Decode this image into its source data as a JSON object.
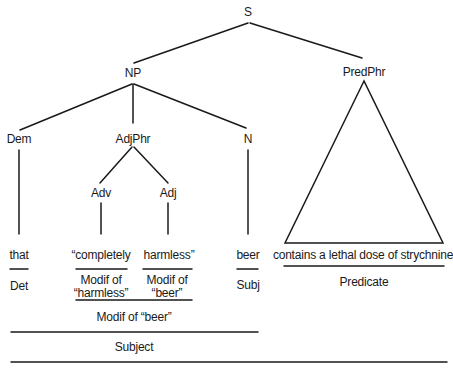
{
  "tree": {
    "root": "S",
    "nodes": {
      "s": "S",
      "np": "NP",
      "predphr": "PredPhr",
      "dem": "Dem",
      "adjphr": "AdjPhr",
      "n": "N",
      "adv": "Adv",
      "adj": "Adj"
    },
    "leaves": {
      "that": "that",
      "completely": "“completely",
      "harmless": "harmless”",
      "beer": "beer",
      "predicate_phrase": "contains a lethal dose of strychnine"
    }
  },
  "functions": {
    "det": "Det",
    "modif_harmless_line1": "Modif of",
    "modif_harmless_line2": "“harmless”",
    "modif_beer_line1": "Modif of",
    "modif_beer_line2": "“beer”",
    "subj": "Subj",
    "predicate": "Predicate",
    "modif_of_beer": "Modif of “beer”",
    "subject": "Subject"
  },
  "colors": {
    "line": "#1a1a1a",
    "background": "#ffffff"
  }
}
